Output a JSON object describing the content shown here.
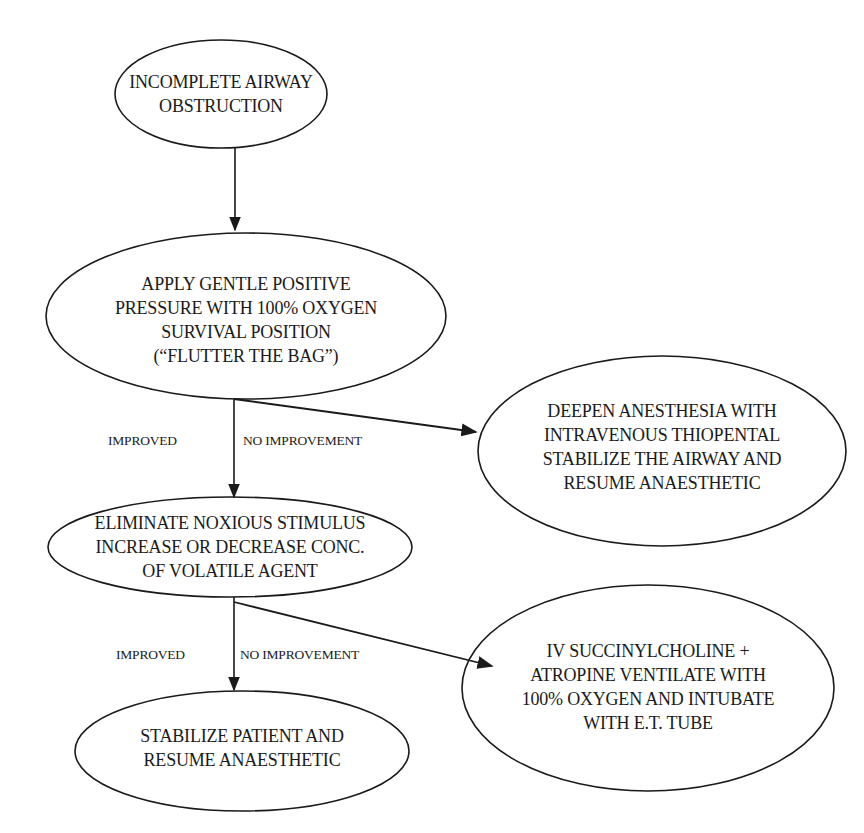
{
  "diagram": {
    "type": "flowchart",
    "stroke_color": "#1a1a1a",
    "background": "#ffffff",
    "nodes": [
      {
        "id": "n1",
        "shape": "ellipse",
        "label": "INCOMPLETE AIRWAY\nOBSTRUCTION"
      },
      {
        "id": "n2",
        "shape": "ellipse",
        "label": "APPLY GENTLE POSITIVE\nPRESSURE WITH 100% OXYGEN\nSURVIVAL POSITION\n(“FLUTTER THE BAG”)"
      },
      {
        "id": "n3",
        "shape": "ellipse",
        "label": "DEEPEN ANESTHESIA WITH\nINTRAVENOUS THIOPENTAL\nSTABILIZE THE AIRWAY AND\nRESUME ANAESTHETIC"
      },
      {
        "id": "n4",
        "shape": "ellipse",
        "label": "ELIMINATE NOXIOUS STIMULUS\nINCREASE OR DECREASE CONC.\nOF VOLATILE AGENT"
      },
      {
        "id": "n5",
        "shape": "ellipse",
        "label": "STABILIZE PATIENT AND\nRESUME ANAESTHETIC"
      },
      {
        "id": "n6",
        "shape": "ellipse",
        "label": "IV SUCCINYLCHOLINE +\nATROPINE VENTILATE WITH\n100% OXYGEN AND INTUBATE\nWITH E.T. TUBE"
      }
    ],
    "edges": [
      {
        "from": "n1",
        "to": "n2",
        "label": ""
      },
      {
        "from": "n2",
        "to": "n4",
        "label": "IMPROVED"
      },
      {
        "from": "n2",
        "to": "n3",
        "label": "NO IMPROVEMENT"
      },
      {
        "from": "n4",
        "to": "n5",
        "label": "IMPROVED"
      },
      {
        "from": "n4",
        "to": "n6",
        "label": "NO IMPROVEMENT"
      }
    ]
  }
}
